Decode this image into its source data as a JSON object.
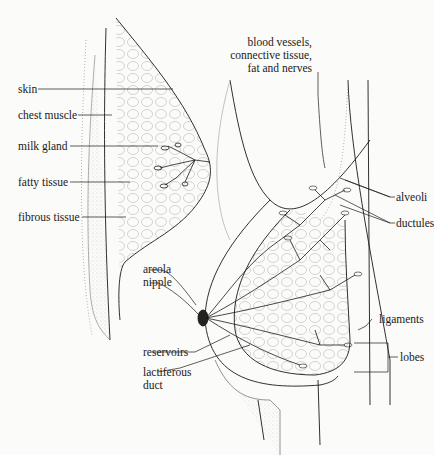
{
  "diagram": {
    "type": "anatomical illustration",
    "left_figure_labels": [
      {
        "id": "skin",
        "text": "skin"
      },
      {
        "id": "chest_muscle",
        "text": "chest muscle"
      },
      {
        "id": "milk_gland",
        "text": "milk gland"
      },
      {
        "id": "fatty_tissue",
        "text": "fatty tissue"
      },
      {
        "id": "fibrous_tissue",
        "text": "fibrous tissue"
      }
    ],
    "right_figure_labels": {
      "top_note": [
        "blood vessels,",
        "connective tissue,",
        "fat and nerves"
      ],
      "alveoli": "alveoli",
      "ductules": "ductules",
      "areola": "areola",
      "nipple": "nipple",
      "ligaments": "ligaments",
      "lobes": "lobes",
      "reservoirs": "reservoirs",
      "lactiferous_duct": [
        "lactiferous",
        "duct"
      ]
    },
    "colors": {
      "ink": "#1a1a1a",
      "background": "#fbfbf9",
      "stipple": "#9a9a9a"
    }
  }
}
